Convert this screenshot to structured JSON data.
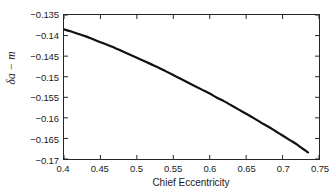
{
  "chart_data": {
    "type": "line",
    "title": "",
    "xlabel": "Chief Eccentricity",
    "ylabel": "δa − m",
    "xlim": [
      0.4,
      0.75
    ],
    "ylim": [
      -0.17,
      -0.135
    ],
    "grid": false,
    "legend": null,
    "xticks": [
      0.4,
      0.45,
      0.5,
      0.55,
      0.6,
      0.65,
      0.7,
      0.75
    ],
    "xtick_labels": [
      "0.4",
      "0.45",
      "0.5",
      "0.55",
      "0.6",
      "0.65",
      "0.7",
      "0.75"
    ],
    "yticks": [
      -0.135,
      -0.14,
      -0.145,
      -0.15,
      -0.155,
      -0.16,
      -0.165,
      -0.17
    ],
    "ytick_labels": [
      "−0.135",
      "−0.14",
      "−0.145",
      "−0.15",
      "−0.155",
      "−0.16",
      "−0.165",
      "−0.17"
    ],
    "series": [
      {
        "name": "delta-a-minus-m",
        "color": "#111111",
        "line_width": 2.2,
        "x": [
          0.4,
          0.41,
          0.42,
          0.43,
          0.44,
          0.45,
          0.46,
          0.47,
          0.48,
          0.49,
          0.5,
          0.51,
          0.52,
          0.53,
          0.54,
          0.55,
          0.56,
          0.57,
          0.58,
          0.59,
          0.6,
          0.61,
          0.62,
          0.63,
          0.64,
          0.65,
          0.66,
          0.67,
          0.68,
          0.69,
          0.7,
          0.71,
          0.72,
          0.73,
          0.735
        ],
        "y": [
          -0.1385,
          -0.139,
          -0.1396,
          -0.1402,
          -0.1409,
          -0.1416,
          -0.1423,
          -0.143,
          -0.1438,
          -0.1446,
          -0.1454,
          -0.1462,
          -0.147,
          -0.1478,
          -0.1487,
          -0.1496,
          -0.1505,
          -0.1514,
          -0.1523,
          -0.1532,
          -0.1541,
          -0.1551,
          -0.156,
          -0.157,
          -0.158,
          -0.159,
          -0.16,
          -0.1611,
          -0.1621,
          -0.1632,
          -0.1643,
          -0.1654,
          -0.1665,
          -0.1678,
          -0.1684
        ]
      }
    ]
  },
  "axes": {
    "x_title": "Chief Eccentricity",
    "y_title": "δa − m"
  }
}
